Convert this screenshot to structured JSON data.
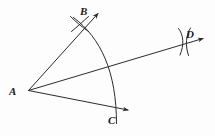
{
  "figure": {
    "kind": "geometry-construction",
    "background_color": "#fdfdfd",
    "ink_color": "#2b2b2b",
    "stroke_width": 1
  },
  "labels": {
    "a": "A",
    "b": "B",
    "c": "C",
    "d": "D"
  },
  "points": {
    "A": {
      "x": 28,
      "y": 91
    },
    "B": {
      "x": 80,
      "y": 25
    },
    "C": {
      "x": 110,
      "y": 112
    },
    "D": {
      "x": 185,
      "y": 41
    }
  },
  "rays": [
    {
      "name": "ray-AB",
      "from": "A",
      "through": "B",
      "tip_x": 99,
      "tip_y": 12
    },
    {
      "name": "ray-AD",
      "from": "A",
      "through": "D",
      "tip_x": 206,
      "tip_y": 38
    },
    {
      "name": "ray-AC",
      "from": "A",
      "through": "C",
      "tip_x": 131,
      "tip_y": 110
    }
  ],
  "arcs": {
    "main_arc": {
      "name": "arc-BC",
      "center": "A",
      "from_x": 74,
      "from_y": 18,
      "to_x": 116,
      "to_y": 123,
      "radius_x": 90,
      "radius_y": 92
    },
    "mark_B": {
      "name": "arc-intersection-mark-B",
      "cx": 80,
      "cy": 25
    },
    "mark_D": {
      "name": "arc-intersection-mark-D",
      "cx": 185,
      "cy": 42
    }
  }
}
